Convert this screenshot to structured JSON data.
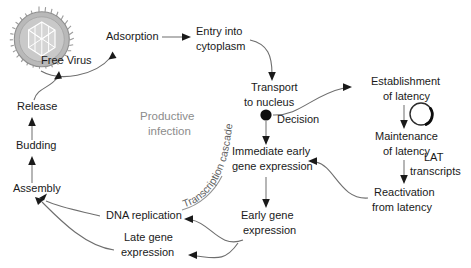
{
  "diagram": {
    "background_color": "#ffffff",
    "text_color": "#1a1a1a",
    "muted_text_color": "#8c8c8c",
    "edge_color": "#6e6e6e"
  },
  "icons": {
    "virion": "free-virus-particle-icon",
    "episome": "circular-episome-icon",
    "decision": "decision-node-dot"
  },
  "nodes": {
    "free_virus": {
      "label": "Free Virus",
      "x": 41,
      "y": 64
    },
    "adsorption": {
      "label": "Adsorption",
      "x": 106,
      "y": 40
    },
    "entry_line1": {
      "label": "Entry into",
      "x": 196,
      "y": 35
    },
    "entry_line2": {
      "label": "cytoplasm",
      "x": 196,
      "y": 50
    },
    "transport_line1": {
      "label": "Transport",
      "x": 251,
      "y": 91
    },
    "transport_line2": {
      "label": "to nucleus",
      "x": 244,
      "y": 106
    },
    "decision": {
      "label": "Decision",
      "x": 277,
      "y": 123
    },
    "establishment_line1": {
      "label": "Establishment",
      "x": 371,
      "y": 85
    },
    "establishment_line2": {
      "label": "of latency",
      "x": 383,
      "y": 100
    },
    "maintenance_line1": {
      "label": "Maintenance",
      "x": 375,
      "y": 140
    },
    "maintenance_line2": {
      "label": "of latency",
      "x": 383,
      "y": 155
    },
    "lat_line1": {
      "label": "LAT",
      "x": 424,
      "y": 161
    },
    "lat_line2": {
      "label": "transcripts",
      "x": 410,
      "y": 175
    },
    "reactivation_line1": {
      "label": "Reactivation",
      "x": 374,
      "y": 196
    },
    "reactivation_line2": {
      "label": "from latency",
      "x": 372,
      "y": 211
    },
    "immediate_line1": {
      "label": "Immediate early",
      "x": 232,
      "y": 155
    },
    "immediate_line2": {
      "label": "gene expression",
      "x": 232,
      "y": 170
    },
    "early_line1": {
      "label": "Early gene",
      "x": 241,
      "y": 219
    },
    "early_line2": {
      "label": "expression",
      "x": 243,
      "y": 234
    },
    "late_line1": {
      "label": "Late gene",
      "x": 124,
      "y": 241
    },
    "late_line2": {
      "label": "expression",
      "x": 121,
      "y": 256
    },
    "dna_replication": {
      "label": "DNA replication",
      "x": 106,
      "y": 219
    },
    "assembly": {
      "label": "Assembly",
      "x": 13,
      "y": 192
    },
    "budding": {
      "label": "Budding",
      "x": 16,
      "y": 149
    },
    "release": {
      "label": "Release",
      "x": 17,
      "y": 110
    }
  },
  "annotations": {
    "productive_line1": {
      "label": "Productive",
      "x": 140,
      "y": 120
    },
    "productive_line2": {
      "label": "infection",
      "x": 148,
      "y": 135
    },
    "transcription_cascade": {
      "label": "Transcription cascade"
    }
  }
}
